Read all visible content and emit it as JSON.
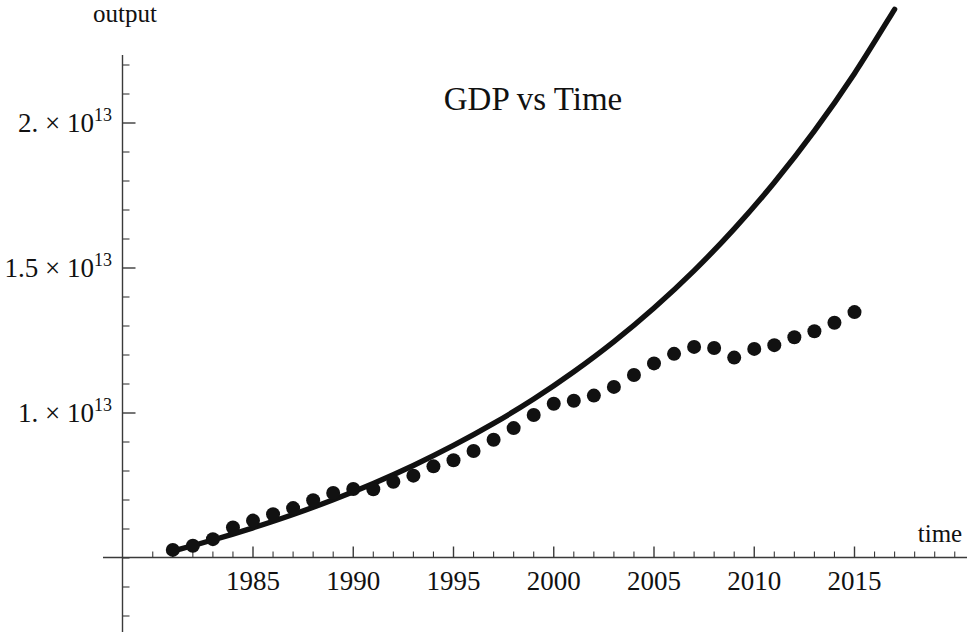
{
  "chart_data": {
    "type": "scatter",
    "title": "GDP  vs  Time",
    "xlabel": "time",
    "ylabel": "output",
    "xlim": [
      1981,
      2017
    ],
    "ylim": [
      5000000000000.0,
      22500000000000.0
    ],
    "grid": false,
    "legend": "none",
    "x_major_ticks": [
      1985,
      1990,
      1995,
      2000,
      2005,
      2010,
      2015
    ],
    "x_tick_labels": [
      "1985",
      "1990",
      "1995",
      "2000",
      "2005",
      "2010",
      "2015"
    ],
    "x_minor_per_interval": 4,
    "y_major_ticks": [
      10000000000000.0,
      15000000000000.0,
      20000000000000.0
    ],
    "y_tick_labels": [
      "1. × 10",
      "1.5 × 10",
      "2. × 10"
    ],
    "y_tick_label_exponents": [
      "13",
      "13",
      "13"
    ],
    "y_minor_per_interval": 4,
    "axis_origin_y_value": 5000000000000.0,
    "series": [
      {
        "name": "data points",
        "marker": "filled-circle",
        "color": "#111111",
        "x": [
          1981,
          1982,
          1983,
          1984,
          1985,
          1986,
          1987,
          1988,
          1989,
          1990,
          1991,
          1992,
          1993,
          1994,
          1995,
          1996,
          1997,
          1998,
          1999,
          2000,
          2001,
          2002,
          2003,
          2004,
          2005,
          2006,
          2007,
          2008,
          2009,
          2010,
          2011,
          2012,
          2013,
          2014,
          2015
        ],
        "y": [
          5280000000000.0,
          5420000000000.0,
          5650000000000.0,
          6050000000000.0,
          6290000000000.0,
          6510000000000.0,
          6720000000000.0,
          6990000000000.0,
          7240000000000.0,
          7380000000000.0,
          7370000000000.0,
          7630000000000.0,
          7840000000000.0,
          8160000000000.0,
          8370000000000.0,
          8690000000000.0,
          9080000000000.0,
          9480000000000.0,
          9930000000000.0,
          10320000000000.0,
          10420000000000.0,
          10600000000000.0,
          10900000000000.0,
          11310000000000.0,
          11710000000000.0,
          12040000000000.0,
          12280000000000.0,
          12240000000000.0,
          11910000000000.0,
          12210000000000.0,
          12340000000000.0,
          12610000000000.0,
          12820000000000.0,
          13110000000000.0,
          13480000000000.0
        ]
      },
      {
        "name": "fitted exponential curve",
        "marker": "none",
        "style": "solid-line",
        "color": "#111111",
        "x": [
          1981,
          1983,
          1985,
          1987,
          1989,
          1991,
          1993,
          1995,
          1997,
          1999,
          2001,
          2003,
          2005,
          2007,
          2009,
          2011,
          2013,
          2015,
          2017
        ],
        "y": [
          5240000000000.0,
          5620000000000.0,
          6040000000000.0,
          6500000000000.0,
          7010000000000.0,
          7570000000000.0,
          8190000000000.0,
          8880000000000.0,
          9640000000000.0,
          10480000000000.0,
          11420000000000.0,
          12460000000000.0,
          13620000000000.0,
          14910000000000.0,
          16350000000000.0,
          17950000000000.0,
          19730000000000.0,
          21710000000000.0,
          23920000000000.0
        ]
      }
    ],
    "annotations": []
  },
  "labels": {
    "title": "GDP  vs  Time",
    "y_axis_name": "output",
    "x_axis_name": "time",
    "y_ticks": [
      {
        "mantissa": "1. × 10",
        "exponent": "13"
      },
      {
        "mantissa": "1.5 × 10",
        "exponent": "13"
      },
      {
        "mantissa": "2. × 10",
        "exponent": "13"
      }
    ],
    "x_ticks": [
      "1985",
      "1990",
      "1995",
      "2000",
      "2005",
      "2010",
      "2015"
    ]
  },
  "colors": {
    "ink": "#111111",
    "axis": "#3a3a3a",
    "background": "#ffffff"
  }
}
